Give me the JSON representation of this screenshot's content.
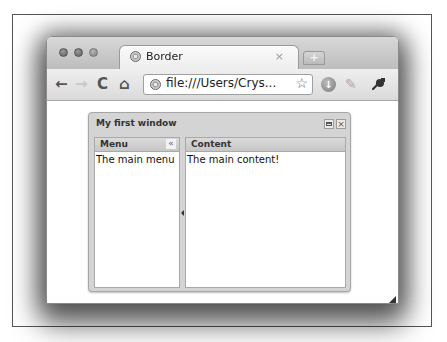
{
  "browser": {
    "tab": {
      "title": "Border",
      "close_glyph": "×",
      "favicon": "globe-icon"
    },
    "new_tab_glyph": "+",
    "toolbar": {
      "back_glyph": "←",
      "forward_glyph": "→",
      "reload_glyph": "C",
      "home_glyph": "⌂",
      "address": "file:///Users/Crys...",
      "star_glyph": "☆",
      "ext_download_glyph": "↓",
      "ext_pen_glyph": "✎",
      "wrench_glyph": "🔧"
    }
  },
  "window": {
    "title": "My first window",
    "close_glyph": "×",
    "menu_panel": {
      "title": "Menu",
      "collapse_glyph": "«",
      "body": "The main menu"
    },
    "content_panel": {
      "title": "Content",
      "body": "The main content!"
    }
  }
}
